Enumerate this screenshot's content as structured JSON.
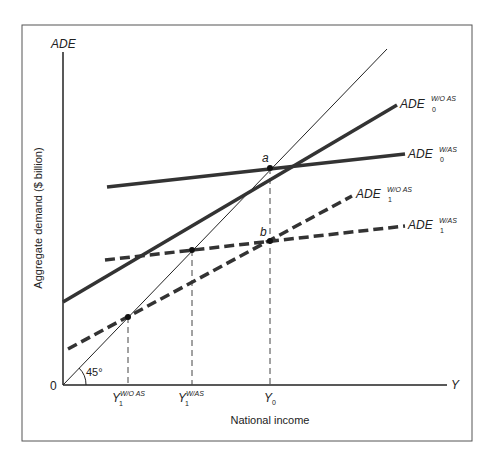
{
  "diagram": {
    "y_axis_title": "ADE",
    "y_axis_label": "Aggregate demand ($ billion)",
    "x_axis_title": "Y",
    "x_axis_label": "National income",
    "origin": "0",
    "angle_label": "45°",
    "points": {
      "a": "a",
      "b": "b"
    },
    "curves": {
      "ade0_wo": {
        "base": "ADE",
        "sup": "W/O AS",
        "sub": "0"
      },
      "ade0_w": {
        "base": "ADE",
        "sup": "W/AS",
        "sub": "0"
      },
      "ade1_wo": {
        "base": "ADE",
        "sup": "W/O AS",
        "sub": "1"
      },
      "ade1_w": {
        "base": "ADE",
        "sup": "W/AS",
        "sub": "1"
      }
    },
    "x_ticks": {
      "y1_wo": {
        "base": "Y",
        "sup": "W/O AS",
        "sub": "1"
      },
      "y1_w": {
        "base": "Y",
        "sup": "W/AS",
        "sub": "1"
      },
      "y0": {
        "base": "Y",
        "sub": "0"
      }
    }
  }
}
